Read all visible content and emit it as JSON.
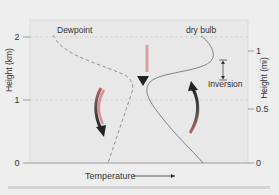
{
  "diagram": {
    "left_axis": {
      "label": "Height (km)",
      "ticks": [
        "2",
        "1",
        "0"
      ]
    },
    "right_axis": {
      "label": "Height (mi)",
      "ticks": [
        "1",
        "0.5",
        "0"
      ]
    },
    "x_axis": {
      "label": "Temperature"
    },
    "curves": {
      "dewpoint_label": "Dewpoint",
      "drybulb_label": "dry bulb"
    },
    "annotations": {
      "inversion_label": "Inversion"
    },
    "colors": {
      "plot_background": "#e9e9e9",
      "outer_background": "#eeeeee",
      "curve": "#666666",
      "arrow_dark": "#2a2a2a",
      "arrow_light": "#d97070"
    }
  }
}
